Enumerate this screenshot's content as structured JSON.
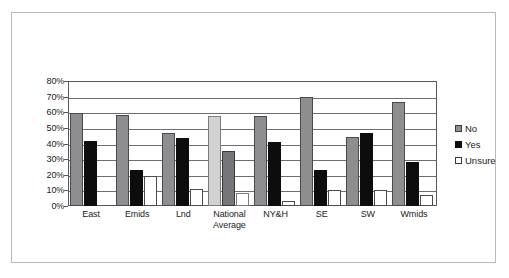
{
  "title_strip": "",
  "chart_data": {
    "type": "bar",
    "title": "",
    "subtitle": "",
    "xlabel": "",
    "ylabel": "",
    "ylim": [
      0,
      80
    ],
    "ytick_labels": [
      "80%",
      "70%",
      "60%",
      "50%",
      "40%",
      "30%",
      "20%",
      "10%",
      "0%"
    ],
    "ytick_values": [
      80,
      70,
      60,
      50,
      40,
      30,
      20,
      10,
      0
    ],
    "grid": true,
    "legend_position": "right",
    "categories": [
      "East",
      "Emids",
      "Lnd",
      "National Average",
      "NY&H",
      "SE",
      "SW",
      "Wmids"
    ],
    "highlight_category": "National Average",
    "series": [
      {
        "name": "No",
        "color": "#8e8e90",
        "values": [
          59.5,
          58.5,
          47.0,
          57.5,
          57.5,
          69.5,
          44.0,
          66.5
        ]
      },
      {
        "name": "Yes",
        "color": "#0d0d0d",
        "values": [
          41.5,
          23.0,
          43.5,
          35.5,
          41.0,
          23.0,
          47.0,
          28.0
        ]
      },
      {
        "name": "Unsure",
        "color": "#ffffff",
        "values": [
          0.0,
          19.5,
          11.0,
          8.5,
          3.0,
          10.0,
          10.5,
          7.0
        ]
      }
    ]
  },
  "legend": {
    "items": [
      {
        "label": "No",
        "swatch": "gray-square-icon"
      },
      {
        "label": "Yes",
        "swatch": "black-square-icon"
      },
      {
        "label": "Unsure",
        "swatch": "white-square-icon"
      }
    ]
  }
}
